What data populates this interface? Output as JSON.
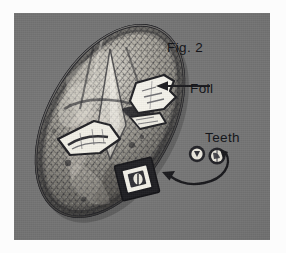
{
  "figure": {
    "caption": "Fig. 2",
    "background_color": "#737373",
    "page_color": "#fcfcfc",
    "ink_color": "#15161a"
  },
  "annotations": [
    {
      "id": "fig",
      "label": "Fig. 2",
      "has_arrow": false
    },
    {
      "id": "foil",
      "label": "Foil",
      "has_arrow": true,
      "arrow_style": "straight",
      "arrow_points_to": "foil-patch-on-mask-eye"
    },
    {
      "id": "teeth",
      "label": "Teeth",
      "has_arrow": true,
      "arrow_style": "curved",
      "arrow_points_to": "mask-mouth"
    }
  ],
  "objects": {
    "mask": {
      "name": "oval-mask",
      "orientation": "tilted-diagonal",
      "shading": "crosshatched-halftone"
    },
    "foil_patches": 3,
    "teeth": {
      "count": 2,
      "description": "two small round teeth beside the mask"
    },
    "mouth": {
      "name": "square-mouth-plate"
    }
  }
}
